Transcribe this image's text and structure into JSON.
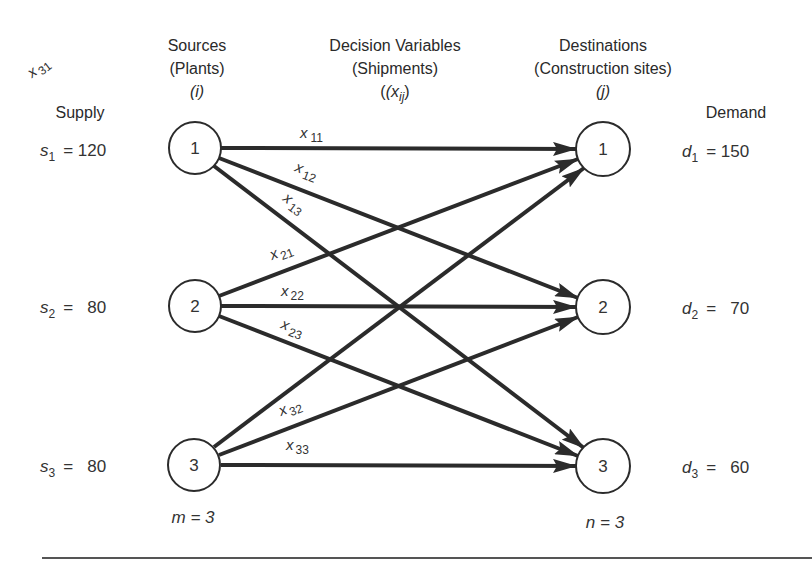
{
  "headers": {
    "supply": "Supply",
    "demand": "Demand",
    "sources": [
      "Sources",
      "(Plants)",
      "(i)"
    ],
    "decision": [
      "Decision Variables",
      "(Shipments)",
      "(x",
      "ij",
      ")"
    ],
    "destinations": [
      "Destinations",
      "(Construction sites)",
      "(j)"
    ]
  },
  "sources": [
    {
      "id": "1",
      "supply_var": "s",
      "sub": "1",
      "value": "= 120"
    },
    {
      "id": "2",
      "supply_var": "s",
      "sub": "2",
      "value": "=   80"
    },
    {
      "id": "3",
      "supply_var": "s",
      "sub": "3",
      "value": "=   80"
    }
  ],
  "destinations": [
    {
      "id": "1",
      "demand_var": "d",
      "sub": "1",
      "value": "= 150"
    },
    {
      "id": "2",
      "demand_var": "d",
      "sub": "2",
      "value": "=   70"
    },
    {
      "id": "3",
      "demand_var": "d",
      "sub": "3",
      "value": "=   60"
    }
  ],
  "counts": {
    "m_label": "m = 3",
    "n_label": "n = 3"
  },
  "edges": [
    {
      "from": 1,
      "to": 1,
      "var": "x",
      "sub": "11"
    },
    {
      "from": 1,
      "to": 2,
      "var": "x",
      "sub": "12"
    },
    {
      "from": 1,
      "to": 3,
      "var": "x",
      "sub": "13"
    },
    {
      "from": 2,
      "to": 1,
      "var": "x",
      "sub": "21"
    },
    {
      "from": 2,
      "to": 2,
      "var": "x",
      "sub": "22"
    },
    {
      "from": 2,
      "to": 3,
      "var": "x",
      "sub": "23"
    },
    {
      "from": 3,
      "to": 1,
      "var": "x",
      "sub": "31"
    },
    {
      "from": 3,
      "to": 2,
      "var": "x",
      "sub": "32"
    },
    {
      "from": 3,
      "to": 3,
      "var": "x",
      "sub": "33"
    }
  ],
  "colors": {
    "line": "#2b2b2b",
    "text": "#2a2a2a",
    "background": "#ffffff"
  }
}
